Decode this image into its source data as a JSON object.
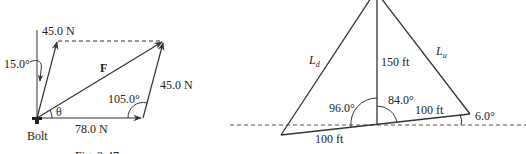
{
  "figures": [
    {
      "id": "left",
      "caption": "Fig. 3-47",
      "labels": {
        "top_force": "45.0 N",
        "angle_vertical": "15.0°",
        "resultant": "F",
        "right_force": "45.0 N",
        "obtuse_angle": "105.0°",
        "theta": "θ",
        "bottom_force": "78.0 N",
        "bolt": "Bolt"
      }
    },
    {
      "id": "right",
      "caption": "",
      "labels": {
        "left_side": "L",
        "left_side_sub": "d",
        "right_side": "L",
        "right_side_sub": "u",
        "height": "150 ft",
        "angle_left": "96.0°",
        "angle_right": "84.0°",
        "base_right": "100 ft",
        "base_left": "100 ft",
        "slope_angle": "6.0°"
      }
    }
  ],
  "colors": {
    "stroke": "#333333",
    "text": "#222222",
    "background": "#ffffff"
  }
}
